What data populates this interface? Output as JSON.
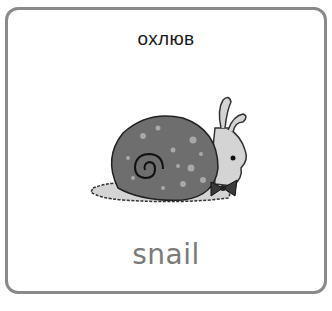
{
  "card": {
    "title": "охлюв",
    "word": "snail",
    "image": {
      "subject": "snail-illustration",
      "shell_color": "#6e6e6e",
      "body_color": "#d4d4d4",
      "bowtie_color": "#3a3a3a"
    },
    "border_color": "#8a8a8a"
  }
}
